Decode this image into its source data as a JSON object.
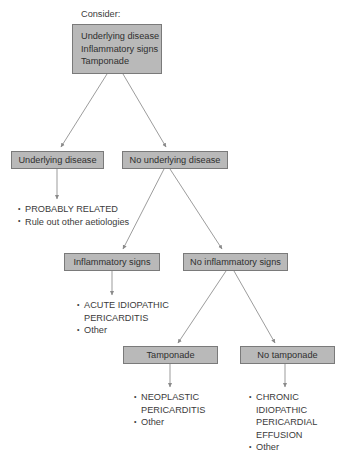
{
  "diagram": {
    "caption": "Consider:",
    "colors": {
      "box_fill": "#b9b9b9",
      "box_border": "#7a7a7a",
      "text": "#3b3b3b",
      "connector": "#8a8a8a",
      "background": "#ffffff"
    }
  },
  "nodes": {
    "root": {
      "lines": [
        "Underlying disease",
        "Inflammatory signs",
        "Tamponade"
      ]
    },
    "underlying_disease": {
      "label": "Underlying disease"
    },
    "no_underlying_disease": {
      "label": "No underlying disease"
    },
    "inflammatory_signs": {
      "label": "Inflammatory signs"
    },
    "no_inflammatory_signs": {
      "label": "No inflammatory signs"
    },
    "tamponade": {
      "label": "Tamponade"
    },
    "no_tamponade": {
      "label": "No tamponade"
    }
  },
  "outcomes": {
    "underlying_disease": [
      {
        "text": "PROBABLY RELATED",
        "bulleted": true
      },
      {
        "text": "Rule out other aetiologies",
        "bulleted": true
      }
    ],
    "inflammatory_signs": [
      {
        "text": "ACUTE IDIOPATHIC",
        "bulleted": true
      },
      {
        "text": "PERICARDITIS",
        "bulleted": false
      },
      {
        "text": "Other",
        "bulleted": true
      }
    ],
    "tamponade": [
      {
        "text": "NEOPLASTIC",
        "bulleted": true
      },
      {
        "text": "PERICARDITIS",
        "bulleted": false
      },
      {
        "text": "Other",
        "bulleted": true
      }
    ],
    "no_tamponade": [
      {
        "text": "CHRONIC",
        "bulleted": true
      },
      {
        "text": "IDIOPATHIC",
        "bulleted": false
      },
      {
        "text": "PERICARDIAL",
        "bulleted": false
      },
      {
        "text": "EFFUSION",
        "bulleted": false
      },
      {
        "text": "Other",
        "bulleted": true
      }
    ]
  }
}
